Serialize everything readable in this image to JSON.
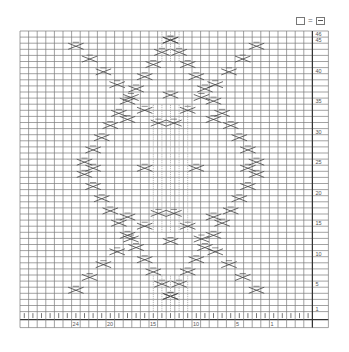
{
  "legend": {
    "items": [
      {
        "symbol": "empty-square",
        "label": "="
      },
      {
        "symbol": "square-with-dash",
        "meaning": "purl"
      }
    ],
    "equals": "="
  },
  "grid": {
    "columns": 34,
    "rows": 46,
    "cell_width": 8.6,
    "cell_height": 6.1,
    "origin_x": 20,
    "origin_y": 31,
    "line_color": "#7a7a7a",
    "symbol_color": "#444444"
  },
  "row_labels": [
    "46",
    "45",
    "40",
    "35",
    "30",
    "25",
    "20",
    "15",
    "10",
    "5",
    "1"
  ],
  "row_label_rows": [
    46,
    45,
    40,
    35,
    30,
    25,
    20,
    15,
    10,
    5,
    1
  ],
  "column_labels": [
    "24",
    "20",
    "15",
    "10",
    "5",
    "1"
  ],
  "column_label_stitches": [
    24,
    20,
    15,
    10,
    5,
    1
  ],
  "pattern": {
    "description": "Argyle / diamond cable knitting chart with diagonal twisted-stitch travelling lines forming a large central lattice diamond, outer diagonal lines toward corners, and a central column of vertical knit stitches",
    "motifs": [
      "diagonal-cross-stitch",
      "cable-cross",
      "vertical-knit-column"
    ]
  }
}
